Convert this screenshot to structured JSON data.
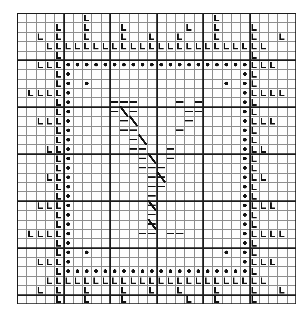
{
  "document": {
    "title": "Cross-stitch pattern chart",
    "kind": "needlework-grid-chart",
    "medium": "graph paper"
  },
  "grid": {
    "columns": 30,
    "rows": 31,
    "cell_px": 9.3,
    "origin_x_px": 17,
    "origin_y_px": 13,
    "width_px": 279,
    "height_px": 291,
    "minor_line_color": "#8d8d8d",
    "major_line_color": "#1a1a1a",
    "major_every": 5,
    "major_line_width_px": 1.8,
    "minor_line_width_px": 0.8,
    "background_color": "#fdfdfd"
  },
  "legend": {
    "symbols": [
      {
        "name": "L-stitch-symbol",
        "glyph": "L",
        "color": "#111111",
        "meaning": "border-motif-stitch"
      },
      {
        "name": "dot-stitch-symbol",
        "glyph": "●",
        "color": "#111111",
        "meaning": "frame-outline-stitch"
      },
      {
        "name": "dash-stitch-symbol",
        "glyph": "—",
        "color": "#111111",
        "meaning": "fill-stitch"
      },
      {
        "name": "slash-stitch-symbol",
        "glyph": "╱",
        "color": "#111111",
        "meaning": "diagonal-stitch"
      }
    ]
  },
  "chart_data": {
    "type": "heatmap",
    "title": "Cross-stitch pattern chart",
    "xlabel": "",
    "ylabel": "",
    "grid": true,
    "legend_position": "none",
    "categories": [
      "L",
      "dot",
      "dash",
      "slash"
    ],
    "xlim": [
      0,
      30
    ],
    "ylim": [
      0,
      31
    ],
    "cells_L": [
      [
        7,
        0
      ],
      [
        21,
        0
      ],
      [
        4,
        1
      ],
      [
        7,
        1
      ],
      [
        11,
        1
      ],
      [
        18,
        1
      ],
      [
        21,
        1
      ],
      [
        25,
        1
      ],
      [
        2,
        2
      ],
      [
        4,
        2
      ],
      [
        7,
        2
      ],
      [
        11,
        2
      ],
      [
        14,
        2
      ],
      [
        17,
        2
      ],
      [
        21,
        2
      ],
      [
        25,
        2
      ],
      [
        28,
        2
      ],
      [
        3,
        3
      ],
      [
        4,
        3
      ],
      [
        5,
        3
      ],
      [
        6,
        3
      ],
      [
        7,
        3
      ],
      [
        8,
        3
      ],
      [
        9,
        3
      ],
      [
        10,
        3
      ],
      [
        11,
        3
      ],
      [
        12,
        3
      ],
      [
        13,
        3
      ],
      [
        14,
        3
      ],
      [
        15,
        3
      ],
      [
        16,
        3
      ],
      [
        17,
        3
      ],
      [
        18,
        3
      ],
      [
        19,
        3
      ],
      [
        20,
        3
      ],
      [
        21,
        3
      ],
      [
        22,
        3
      ],
      [
        23,
        3
      ],
      [
        24,
        3
      ],
      [
        25,
        3
      ],
      [
        26,
        3
      ],
      [
        4,
        4
      ],
      [
        25,
        4
      ],
      [
        2,
        5
      ],
      [
        3,
        5
      ],
      [
        4,
        5
      ],
      [
        25,
        5
      ],
      [
        26,
        5
      ],
      [
        27,
        5
      ],
      [
        4,
        6
      ],
      [
        25,
        6
      ],
      [
        4,
        7
      ],
      [
        25,
        7
      ],
      [
        1,
        8
      ],
      [
        2,
        8
      ],
      [
        3,
        8
      ],
      [
        4,
        8
      ],
      [
        25,
        8
      ],
      [
        26,
        8
      ],
      [
        27,
        8
      ],
      [
        28,
        8
      ],
      [
        4,
        9
      ],
      [
        25,
        9
      ],
      [
        4,
        10
      ],
      [
        25,
        10
      ],
      [
        2,
        11
      ],
      [
        3,
        11
      ],
      [
        4,
        11
      ],
      [
        25,
        11
      ],
      [
        26,
        11
      ],
      [
        27,
        11
      ],
      [
        4,
        12
      ],
      [
        25,
        12
      ],
      [
        4,
        13
      ],
      [
        25,
        13
      ],
      [
        3,
        14
      ],
      [
        4,
        14
      ],
      [
        25,
        14
      ],
      [
        26,
        14
      ],
      [
        4,
        15
      ],
      [
        25,
        15
      ],
      [
        4,
        16
      ],
      [
        25,
        16
      ],
      [
        3,
        17
      ],
      [
        4,
        17
      ],
      [
        25,
        17
      ],
      [
        26,
        17
      ],
      [
        4,
        18
      ],
      [
        25,
        18
      ],
      [
        4,
        19
      ],
      [
        25,
        19
      ],
      [
        2,
        20
      ],
      [
        3,
        20
      ],
      [
        4,
        20
      ],
      [
        25,
        20
      ],
      [
        26,
        20
      ],
      [
        27,
        20
      ],
      [
        4,
        21
      ],
      [
        25,
        21
      ],
      [
        4,
        22
      ],
      [
        25,
        22
      ],
      [
        1,
        23
      ],
      [
        2,
        23
      ],
      [
        3,
        23
      ],
      [
        4,
        23
      ],
      [
        25,
        23
      ],
      [
        26,
        23
      ],
      [
        27,
        23
      ],
      [
        28,
        23
      ],
      [
        4,
        24
      ],
      [
        25,
        24
      ],
      [
        4,
        25
      ],
      [
        25,
        25
      ],
      [
        2,
        26
      ],
      [
        3,
        26
      ],
      [
        4,
        26
      ],
      [
        25,
        26
      ],
      [
        26,
        26
      ],
      [
        27,
        26
      ],
      [
        4,
        27
      ],
      [
        25,
        27
      ],
      [
        3,
        28
      ],
      [
        4,
        28
      ],
      [
        5,
        28
      ],
      [
        6,
        28
      ],
      [
        7,
        28
      ],
      [
        8,
        28
      ],
      [
        9,
        28
      ],
      [
        10,
        28
      ],
      [
        11,
        28
      ],
      [
        12,
        28
      ],
      [
        13,
        28
      ],
      [
        14,
        28
      ],
      [
        15,
        28
      ],
      [
        16,
        28
      ],
      [
        17,
        28
      ],
      [
        18,
        28
      ],
      [
        19,
        28
      ],
      [
        20,
        28
      ],
      [
        21,
        28
      ],
      [
        22,
        28
      ],
      [
        23,
        28
      ],
      [
        24,
        28
      ],
      [
        25,
        28
      ],
      [
        26,
        28
      ],
      [
        2,
        29
      ],
      [
        4,
        29
      ],
      [
        7,
        29
      ],
      [
        11,
        29
      ],
      [
        14,
        29
      ],
      [
        17,
        29
      ],
      [
        21,
        29
      ],
      [
        25,
        29
      ],
      [
        28,
        29
      ],
      [
        4,
        30
      ],
      [
        7,
        30
      ],
      [
        11,
        30
      ],
      [
        18,
        30
      ],
      [
        21,
        30
      ],
      [
        25,
        30
      ],
      [
        7,
        31
      ],
      [
        21,
        31
      ]
    ],
    "cells_dot": [
      [
        5,
        5
      ],
      [
        6,
        5
      ],
      [
        7,
        5
      ],
      [
        8,
        5
      ],
      [
        9,
        5
      ],
      [
        10,
        5
      ],
      [
        11,
        5
      ],
      [
        12,
        5
      ],
      [
        13,
        5
      ],
      [
        14,
        5
      ],
      [
        15,
        5
      ],
      [
        16,
        5
      ],
      [
        17,
        5
      ],
      [
        18,
        5
      ],
      [
        19,
        5
      ],
      [
        20,
        5
      ],
      [
        21,
        5
      ],
      [
        22,
        5
      ],
      [
        23,
        5
      ],
      [
        24,
        5
      ],
      [
        5,
        6
      ],
      [
        24,
        6
      ],
      [
        5,
        7
      ],
      [
        7,
        7
      ],
      [
        22,
        7
      ],
      [
        24,
        7
      ],
      [
        5,
        8
      ],
      [
        24,
        8
      ],
      [
        5,
        9
      ],
      [
        24,
        9
      ],
      [
        5,
        10
      ],
      [
        24,
        10
      ],
      [
        5,
        11
      ],
      [
        24,
        11
      ],
      [
        5,
        12
      ],
      [
        24,
        12
      ],
      [
        5,
        13
      ],
      [
        24,
        13
      ],
      [
        5,
        14
      ],
      [
        24,
        14
      ],
      [
        5,
        15
      ],
      [
        24,
        15
      ],
      [
        5,
        16
      ],
      [
        24,
        16
      ],
      [
        5,
        17
      ],
      [
        24,
        17
      ],
      [
        5,
        18
      ],
      [
        24,
        18
      ],
      [
        5,
        19
      ],
      [
        24,
        19
      ],
      [
        5,
        20
      ],
      [
        24,
        20
      ],
      [
        5,
        21
      ],
      [
        24,
        21
      ],
      [
        5,
        22
      ],
      [
        24,
        22
      ],
      [
        5,
        23
      ],
      [
        24,
        23
      ],
      [
        5,
        24
      ],
      [
        24,
        24
      ],
      [
        5,
        25
      ],
      [
        7,
        25
      ],
      [
        22,
        25
      ],
      [
        24,
        25
      ],
      [
        5,
        26
      ],
      [
        24,
        26
      ],
      [
        5,
        27
      ],
      [
        6,
        27
      ],
      [
        7,
        27
      ],
      [
        8,
        27
      ],
      [
        9,
        27
      ],
      [
        10,
        27
      ],
      [
        11,
        27
      ],
      [
        12,
        27
      ],
      [
        13,
        27
      ],
      [
        14,
        27
      ],
      [
        15,
        27
      ],
      [
        16,
        27
      ],
      [
        17,
        27
      ],
      [
        18,
        27
      ],
      [
        19,
        27
      ],
      [
        20,
        27
      ],
      [
        21,
        27
      ],
      [
        22,
        27
      ],
      [
        23,
        27
      ],
      [
        24,
        27
      ]
    ],
    "cells_dash": [
      [
        10,
        9
      ],
      [
        11,
        9
      ],
      [
        12,
        9
      ],
      [
        17,
        9
      ],
      [
        19,
        9
      ],
      [
        10,
        10
      ],
      [
        12,
        10
      ],
      [
        18,
        10
      ],
      [
        19,
        10
      ],
      [
        11,
        11
      ],
      [
        18,
        11
      ],
      [
        11,
        12
      ],
      [
        12,
        12
      ],
      [
        17,
        12
      ],
      [
        12,
        13
      ],
      [
        12,
        14
      ],
      [
        13,
        14
      ],
      [
        16,
        14
      ],
      [
        13,
        15
      ],
      [
        16,
        15
      ],
      [
        13,
        16
      ],
      [
        14,
        16
      ],
      [
        15,
        16
      ],
      [
        14,
        17
      ],
      [
        15,
        17
      ],
      [
        14,
        18
      ],
      [
        15,
        18
      ],
      [
        14,
        19
      ],
      [
        14,
        20
      ],
      [
        14,
        21
      ],
      [
        14,
        22
      ],
      [
        13,
        23
      ],
      [
        14,
        23
      ],
      [
        16,
        23
      ],
      [
        17,
        23
      ]
    ],
    "cells_slash": [
      [
        11,
        10
      ],
      [
        12,
        11
      ],
      [
        13,
        13
      ],
      [
        14,
        15
      ],
      [
        15,
        17
      ],
      [
        14,
        20
      ],
      [
        14,
        22
      ]
    ]
  }
}
